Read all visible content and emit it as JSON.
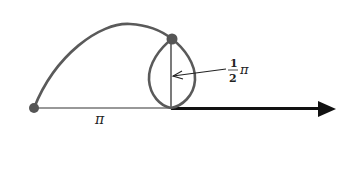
{
  "diagram": {
    "labels": {
      "pi": "π",
      "half_numerator": "1",
      "half_denominator": "2",
      "half_pi_symbol": "π"
    },
    "colors": {
      "curve": "#5a5a5a",
      "axis": "#111111",
      "point": "#555555",
      "background": "#ffffff"
    }
  }
}
